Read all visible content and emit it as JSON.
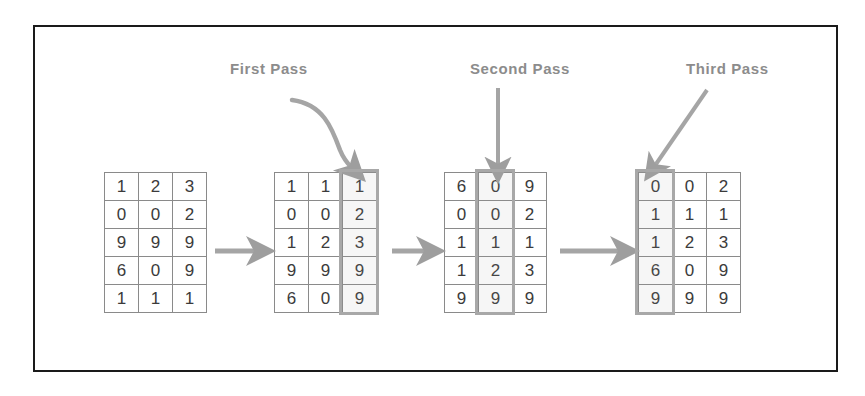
{
  "diagram": {
    "title_visible": false,
    "frame_color": "#1a1a1a",
    "grid_border_color": "#8a8a8a",
    "highlight_color": "#a8a8a8",
    "arrow_color": "#9e9e9e",
    "label_color": "#8c8c8c",
    "digit_color": "#3b3b3b"
  },
  "labels": {
    "first": "First Pass",
    "second": "Second Pass",
    "third": "Third Pass"
  },
  "grids": [
    {
      "name": "initial-grid",
      "rows": [
        [
          "1",
          "2",
          "3"
        ],
        [
          "0",
          "0",
          "2"
        ],
        [
          "9",
          "9",
          "9"
        ],
        [
          "6",
          "0",
          "9"
        ],
        [
          "1",
          "1",
          "1"
        ]
      ],
      "highlight_column": null
    },
    {
      "name": "first-pass-grid",
      "rows": [
        [
          "1",
          "1",
          "1"
        ],
        [
          "0",
          "0",
          "2"
        ],
        [
          "1",
          "2",
          "3"
        ],
        [
          "9",
          "9",
          "9"
        ],
        [
          "6",
          "0",
          "9"
        ]
      ],
      "highlight_column": 2
    },
    {
      "name": "second-pass-grid",
      "rows": [
        [
          "6",
          "0",
          "9"
        ],
        [
          "0",
          "0",
          "2"
        ],
        [
          "1",
          "1",
          "1"
        ],
        [
          "1",
          "2",
          "3"
        ],
        [
          "9",
          "9",
          "9"
        ]
      ],
      "highlight_column": 1
    },
    {
      "name": "third-pass-grid",
      "rows": [
        [
          "0",
          "0",
          "2"
        ],
        [
          "1",
          "1",
          "1"
        ],
        [
          "1",
          "2",
          "3"
        ],
        [
          "6",
          "0",
          "9"
        ],
        [
          "9",
          "9",
          "9"
        ]
      ],
      "highlight_column": 0
    }
  ],
  "arrows": {
    "flow": [
      "grid1-to-grid2",
      "grid2-to-grid3",
      "grid3-to-grid4"
    ],
    "pointers": [
      "first-pass-curved-arrow",
      "second-pass-down-arrow",
      "third-pass-diagonal-arrow"
    ]
  }
}
